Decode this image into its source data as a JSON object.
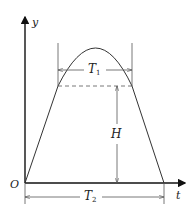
{
  "diagram": {
    "type": "trajectory-profile",
    "axes": {
      "x_label": "t",
      "y_label": "y",
      "origin_label": "O"
    },
    "annotations": {
      "T1": {
        "symbol": "T",
        "subscript": "1"
      },
      "T2": {
        "symbol": "T",
        "subscript": "2"
      },
      "H": {
        "symbol": "H"
      }
    },
    "colors": {
      "axis": "#111111",
      "curve": "#333333",
      "dimension": "#555555"
    }
  }
}
